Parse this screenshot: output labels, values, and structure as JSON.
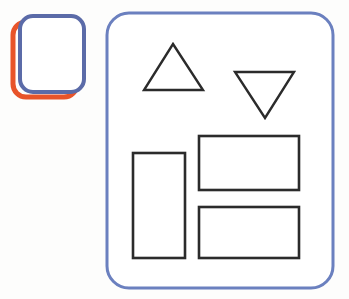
{
  "page": {
    "title": "Shapes Diagram",
    "background_color": "#fdfdfc",
    "width": 349,
    "height": 299
  },
  "palette": {
    "blue_stroke": "#6b80bf",
    "blue_stroke_dark": "#5b6ba8",
    "orange_stroke": "#e8542a",
    "black_stroke": "#2b2b2b",
    "fill_white": "#ffffff"
  },
  "thumbnail": {
    "name": "Rounded square thumbnail with offset shadow",
    "front_square": {
      "label": "blue rounded square",
      "x": 20,
      "y": 16,
      "width": 64,
      "height": 76,
      "radius": 13,
      "stroke": "#5b6ba8",
      "stroke_width": 4,
      "fill": "#ffffff"
    },
    "shadow_square": {
      "label": "orange rounded square",
      "x": 13,
      "y": 22,
      "width": 64,
      "height": 75,
      "radius": 13,
      "stroke": "#e8542a",
      "stroke_width": 5,
      "fill": "none"
    }
  },
  "panel": {
    "name": "Large rounded rectangle panel",
    "x": 107,
    "y": 13,
    "width": 226,
    "height": 275,
    "radius": 22,
    "stroke": "#6b80bf",
    "stroke_width": 3,
    "fill": "#ffffff"
  },
  "shapes": [
    {
      "id": "triangle-up",
      "label": "Triangle pointing up",
      "type": "triangle",
      "orientation": "up",
      "points": "173,44 203,90 144,90",
      "stroke": "#2b2b2b",
      "stroke_width": 2.4,
      "fill": "#ffffff"
    },
    {
      "id": "triangle-down",
      "label": "Triangle pointing down",
      "type": "triangle",
      "orientation": "down",
      "points": "235,72 294,72 265,118",
      "stroke": "#2b2b2b",
      "stroke_width": 2.4,
      "fill": "#ffffff"
    },
    {
      "id": "rect-tall-left",
      "label": "Tall vertical rectangle",
      "type": "rect",
      "x": 133,
      "y": 153,
      "width": 52,
      "height": 105,
      "stroke": "#2b2b2b",
      "stroke_width": 2.6,
      "fill": "#ffffff"
    },
    {
      "id": "rect-wide-top",
      "label": "Wide rectangle upper right",
      "type": "rect",
      "x": 199,
      "y": 136,
      "width": 100,
      "height": 54,
      "stroke": "#2b2b2b",
      "stroke_width": 2.6,
      "fill": "#ffffff"
    },
    {
      "id": "rect-wide-bottom",
      "label": "Wide rectangle lower right",
      "type": "rect",
      "x": 199,
      "y": 207,
      "width": 100,
      "height": 51,
      "stroke": "#2b2b2b",
      "stroke_width": 2.6,
      "fill": "#ffffff"
    }
  ]
}
